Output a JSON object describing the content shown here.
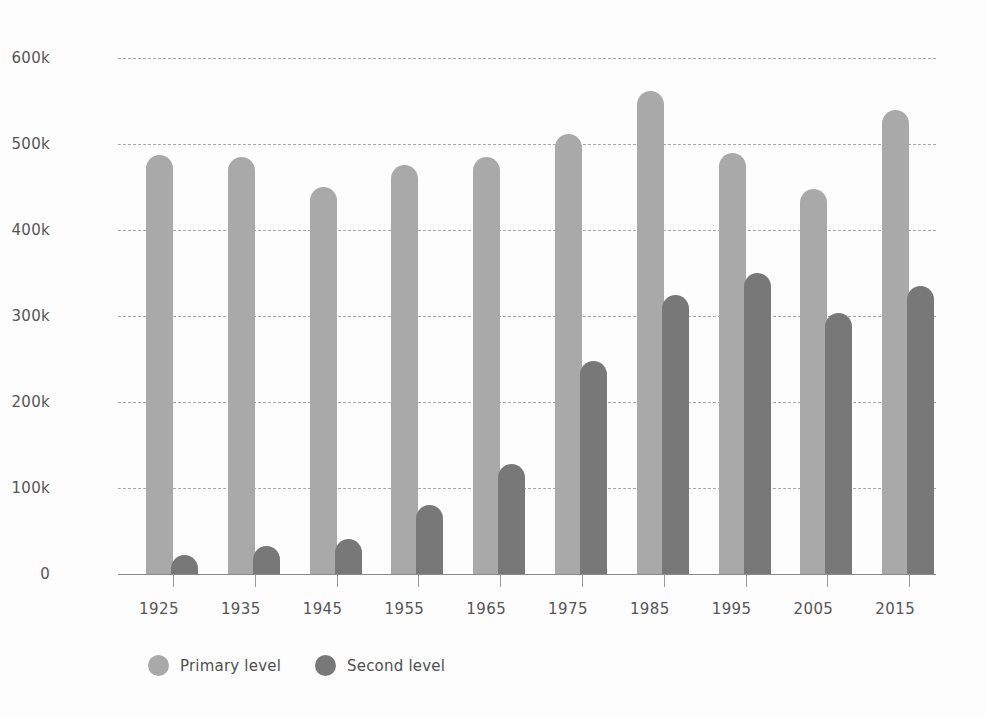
{
  "chart_data": {
    "type": "bar",
    "title": "",
    "subtitle": "",
    "xlabel": "",
    "ylabel": "",
    "categories": [
      "1925",
      "1935",
      "1945",
      "1955",
      "1965",
      "1975",
      "1985",
      "1995",
      "2005",
      "2015"
    ],
    "series": [
      {
        "name": "Primary level",
        "color": "#a9a9a9",
        "values": [
          487000,
          485000,
          450000,
          476000,
          485000,
          512000,
          562000,
          490000,
          448000,
          540000
        ]
      },
      {
        "name": "Second level",
        "color": "#787878",
        "values": [
          22000,
          33000,
          41000,
          80000,
          128000,
          248000,
          325000,
          350000,
          304000,
          335000
        ]
      }
    ],
    "ylim": [
      0,
      600000
    ],
    "y_ticks": [
      0,
      100000,
      200000,
      300000,
      400000,
      500000,
      600000
    ],
    "y_tick_labels": [
      "0",
      "100k",
      "200k",
      "300k",
      "400k",
      "500k",
      "600k"
    ],
    "grid": "horizontal-dashed",
    "legend_position": "bottom-left",
    "bar_style": "rounded-top",
    "background": "#fdfdfd"
  },
  "legend": {
    "items": [
      {
        "label": "Primary level",
        "swatch": "circle-swatch-primary"
      },
      {
        "label": "Second level",
        "swatch": "circle-swatch-secondary"
      }
    ]
  }
}
